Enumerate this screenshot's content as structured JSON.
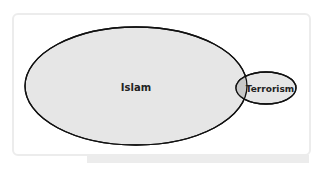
{
  "diagram": {
    "type": "venn",
    "sets": [
      {
        "label": "Islam",
        "fill": "#e6e6e6",
        "stroke": "#111111"
      },
      {
        "label": "Terrorism",
        "fill": "#e6e6e6",
        "stroke": "#111111"
      }
    ],
    "overlap_fill": "#c8c8c8",
    "frame_color": "#ececec"
  }
}
